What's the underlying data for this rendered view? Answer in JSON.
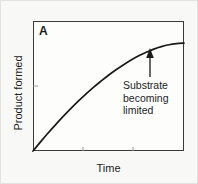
{
  "figure": {
    "panel_label": "A",
    "background_color": "#f8f8f6",
    "frame_color": "#3b3b3b",
    "curve_color": "#1a1a1a",
    "text_color": "#1c1c1c"
  },
  "annotation": {
    "line1": "Substrate",
    "line2": "becoming",
    "line3": "limited",
    "arrow": "up-arrow-icon",
    "arrow_x_fraction": 0.775
  },
  "chart_data": {
    "type": "line",
    "title": "",
    "subtitle": "",
    "xlabel": "Time",
    "ylabel": "Product formed",
    "legend": [],
    "legend_position": "none",
    "grid": false,
    "xlim": [
      0,
      1
    ],
    "ylim": [
      0,
      1
    ],
    "xticks": [
      0.0,
      0.33,
      0.67,
      1.0
    ],
    "yticks": [
      0.0,
      0.5,
      1.0
    ],
    "xticklabels": [
      "",
      "",
      "",
      ""
    ],
    "yticklabels": [
      "",
      "",
      ""
    ],
    "annotations": [
      {
        "text": "Substrate becoming limited",
        "x": 0.775,
        "y": 0.8,
        "arrow": "up"
      }
    ],
    "series": [
      {
        "name": "Product formed",
        "comment": "saturating (hyperbolic) progress curve, starts at origin, plateaus near 0.82",
        "x": [
          0.0,
          0.05,
          0.1,
          0.15,
          0.2,
          0.25,
          0.3,
          0.35,
          0.4,
          0.45,
          0.5,
          0.55,
          0.6,
          0.65,
          0.7,
          0.75,
          0.8,
          0.85,
          0.9,
          0.95,
          1.0
        ],
        "y": [
          0.0,
          0.07,
          0.138,
          0.203,
          0.266,
          0.326,
          0.383,
          0.437,
          0.489,
          0.537,
          0.583,
          0.625,
          0.664,
          0.7,
          0.732,
          0.76,
          0.784,
          0.803,
          0.817,
          0.826,
          0.83
        ]
      }
    ]
  }
}
